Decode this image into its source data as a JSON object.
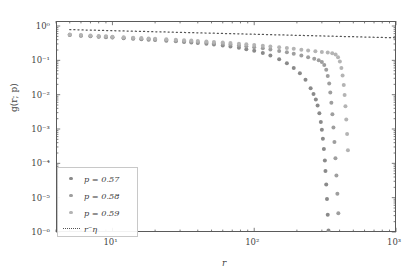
{
  "axes": {
    "xlabel": "r",
    "ylabel": "g(r; p)",
    "x_ticks": [
      {
        "v": 10,
        "label": "10¹"
      },
      {
        "v": 100,
        "label": "10²"
      },
      {
        "v": 1000,
        "label": "10³"
      }
    ],
    "y_ticks": [
      {
        "v": 1,
        "label": "10⁰"
      },
      {
        "v": 0.1,
        "label": "10⁻¹"
      },
      {
        "v": 0.01,
        "label": "10⁻²"
      },
      {
        "v": 0.001,
        "label": "10⁻³"
      },
      {
        "v": 0.0001,
        "label": "10⁻⁴"
      },
      {
        "v": 1e-05,
        "label": "10⁻⁵"
      },
      {
        "v": 1e-06,
        "label": "10⁻⁶"
      }
    ],
    "xlim": [
      4,
      1000
    ],
    "ylim": [
      1e-06,
      1.4
    ]
  },
  "legend": {
    "entries": [
      {
        "label": "p = 0.57",
        "color": "#8a8a8a",
        "marker": "dot"
      },
      {
        "label": "p = 0.58",
        "color": "#9e9e9e",
        "marker": "dot"
      },
      {
        "label": "p = 0.59",
        "color": "#b4b4b4",
        "marker": "dot"
      },
      {
        "label": "r⁻η",
        "color": "#555555",
        "marker": "dotted-line"
      }
    ]
  },
  "chart_data": {
    "type": "scatter",
    "title": "",
    "xlabel": "r",
    "ylabel": "g(r; p)",
    "xscale": "log",
    "yscale": "log",
    "xlim": [
      4,
      1000
    ],
    "ylim": [
      1e-06,
      1.4
    ],
    "grid": false,
    "legend_position": "lower left",
    "series": [
      {
        "name": "p = 0.57",
        "color": "#8a8a8a",
        "x": [
          5,
          6,
          7,
          8,
          9,
          10,
          12,
          14,
          16,
          18,
          20,
          24,
          28,
          32,
          36,
          40,
          46,
          52,
          60,
          68,
          78,
          88,
          100,
          115,
          130,
          150,
          170,
          190,
          210,
          230,
          250,
          262,
          272,
          280,
          288,
          295,
          300,
          305,
          310,
          315,
          318,
          322,
          326,
          330,
          334
        ],
        "y": [
          0.55,
          0.52,
          0.5,
          0.485,
          0.47,
          0.46,
          0.44,
          0.425,
          0.412,
          0.4,
          0.39,
          0.372,
          0.357,
          0.344,
          0.332,
          0.32,
          0.305,
          0.29,
          0.272,
          0.254,
          0.232,
          0.212,
          0.19,
          0.163,
          0.138,
          0.108,
          0.082,
          0.06,
          0.042,
          0.027,
          0.0155,
          0.0105,
          0.0072,
          0.0048,
          0.0029,
          0.0016,
          0.00095,
          0.00052,
          0.00026,
          0.00012,
          6e-05,
          2.4e-05,
          9.2e-06,
          3.2e-06,
          1.1e-06
        ]
      },
      {
        "name": "p = 0.58",
        "color": "#9e9e9e",
        "x": [
          5,
          6,
          7,
          8,
          9,
          10,
          12,
          14,
          16,
          18,
          20,
          24,
          28,
          32,
          36,
          40,
          46,
          52,
          60,
          68,
          78,
          88,
          100,
          115,
          130,
          150,
          170,
          190,
          215,
          240,
          265,
          285,
          300,
          312,
          322,
          330,
          338,
          344,
          350,
          356,
          362,
          368,
          374,
          380,
          386,
          392
        ],
        "y": [
          0.56,
          0.53,
          0.513,
          0.497,
          0.484,
          0.473,
          0.454,
          0.439,
          0.427,
          0.416,
          0.406,
          0.389,
          0.375,
          0.363,
          0.352,
          0.342,
          0.329,
          0.317,
          0.302,
          0.288,
          0.272,
          0.258,
          0.242,
          0.224,
          0.208,
          0.188,
          0.171,
          0.156,
          0.139,
          0.124,
          0.111,
          0.1,
          0.089,
          0.073,
          0.053,
          0.035,
          0.021,
          0.0115,
          0.0058,
          0.0027,
          0.0011,
          0.00042,
          0.00014,
          4.4e-05,
          1.3e-05,
          3.5e-06
        ]
      },
      {
        "name": "p = 0.59",
        "color": "#b4b4b4",
        "x": [
          5,
          6,
          7,
          8,
          9,
          10,
          12,
          14,
          16,
          18,
          20,
          24,
          28,
          32,
          36,
          40,
          46,
          52,
          60,
          68,
          78,
          88,
          100,
          115,
          130,
          150,
          170,
          190,
          215,
          240,
          270,
          300,
          330,
          355,
          375,
          390,
          402,
          412,
          420,
          428,
          434,
          440,
          446,
          452,
          458
        ],
        "y": [
          0.57,
          0.545,
          0.527,
          0.512,
          0.5,
          0.489,
          0.471,
          0.457,
          0.445,
          0.435,
          0.426,
          0.41,
          0.397,
          0.386,
          0.376,
          0.367,
          0.355,
          0.344,
          0.331,
          0.319,
          0.306,
          0.294,
          0.281,
          0.267,
          0.254,
          0.239,
          0.227,
          0.216,
          0.204,
          0.194,
          0.184,
          0.176,
          0.169,
          0.161,
          0.148,
          0.124,
          0.092,
          0.06,
          0.036,
          0.019,
          0.0098,
          0.0046,
          0.0019,
          0.00072,
          0.00024
        ]
      }
    ],
    "reference_line": {
      "name": "r⁻η",
      "color": "#555555",
      "style": "dotted",
      "exponent": -0.104,
      "amplitude": 0.93,
      "x_start": 5,
      "x_end": 980,
      "y_start": 0.8,
      "y_end": 0.365
    }
  }
}
